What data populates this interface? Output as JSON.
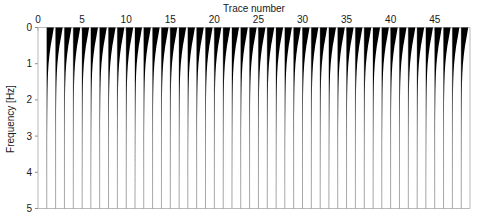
{
  "chart_data": {
    "type": "line",
    "title": "",
    "xlabel": "Trace number",
    "ylabel": "Frequency [Hz]",
    "xlabel_position": "top",
    "grid": false,
    "legend": null,
    "xlim": [
      0,
      49
    ],
    "ylim": [
      0,
      5
    ],
    "y_inverted": true,
    "xticks": [
      0,
      5,
      10,
      15,
      20,
      25,
      30,
      35,
      40,
      45
    ],
    "xticklabels": [
      "0",
      "5",
      "10",
      "15",
      "20",
      "25",
      "30",
      "35",
      "40",
      "45"
    ],
    "yticks": [
      0,
      1,
      2,
      3,
      4,
      5
    ],
    "yticklabels": [
      "0",
      "1",
      "2",
      "3",
      "4",
      "5"
    ],
    "style": "wiggle-variable-area",
    "fill_color": "#000000",
    "line_color": "#9a9a9a",
    "trace_count": 48,
    "trace_numbers": [
      1,
      2,
      3,
      4,
      5,
      6,
      7,
      8,
      9,
      10,
      11,
      12,
      13,
      14,
      15,
      16,
      17,
      18,
      19,
      20,
      21,
      22,
      23,
      24,
      25,
      26,
      27,
      28,
      29,
      30,
      31,
      32,
      33,
      34,
      35,
      36,
      37,
      38,
      39,
      40,
      41,
      42,
      43,
      44,
      45,
      46,
      47,
      48
    ],
    "amplitude_profile": {
      "description": "Each trace is an amplitude spectrum plotted sideways: maximum amplitude at 0 Hz decaying toward 5 Hz.",
      "frequencies_hz": [
        0.0,
        0.25,
        0.5,
        0.75,
        1.0,
        1.25,
        1.5,
        1.75,
        2.0,
        2.5,
        3.0,
        3.5,
        4.0,
        4.5,
        5.0
      ],
      "normalized_amplitude": [
        1.0,
        0.78,
        0.55,
        0.38,
        0.25,
        0.17,
        0.12,
        0.09,
        0.07,
        0.045,
        0.03,
        0.022,
        0.016,
        0.012,
        0.01
      ]
    },
    "series": [
      {
        "name": "trace-spectrum",
        "values": [
          1.0,
          0.78,
          0.55,
          0.38,
          0.25,
          0.17,
          0.12,
          0.09,
          0.07,
          0.045,
          0.03,
          0.022,
          0.016,
          0.012,
          0.01
        ]
      }
    ]
  },
  "axes": {
    "xlabel": "Trace number",
    "ylabel": "Frequency [Hz]"
  }
}
